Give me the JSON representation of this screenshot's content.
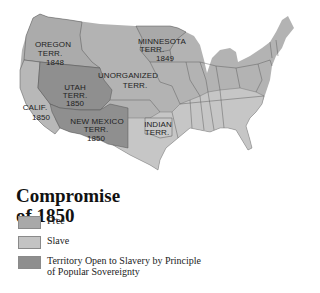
{
  "map": {
    "title_line1": "Compromise",
    "title_line2": "of 1850",
    "colors": {
      "free": "#a9a9a9",
      "slave": "#c3c3c3",
      "popular_sovereignty": "#8e8e8e",
      "border": "#555555",
      "background": "#ffffff"
    },
    "labels": {
      "oregon": [
        "OREGON",
        "TERR.",
        "1848"
      ],
      "minnesota": [
        "MINNESOTA",
        "TERR.",
        "1849"
      ],
      "unorganized": [
        "UNORGANIZED",
        "TERR."
      ],
      "utah": [
        "UTAH",
        "TERR.",
        "1850"
      ],
      "california": [
        "CALIF.",
        "1850"
      ],
      "new_mexico": [
        "NEW MEXICO",
        "TERR.",
        "1850"
      ],
      "indian": [
        "INDIAN",
        "TERR."
      ]
    }
  },
  "legend": {
    "items": [
      {
        "label": "Free",
        "color": "#a9a9a9"
      },
      {
        "label": "Slave",
        "color": "#c3c3c3"
      },
      {
        "label": "Territory Open to Slavery by Principle of Popular Sovereignty",
        "color": "#8e8e8e"
      }
    ]
  }
}
